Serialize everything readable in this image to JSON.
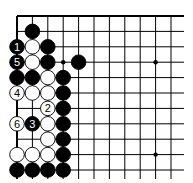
{
  "diagram": {
    "type": "go-board-fragment",
    "grid": {
      "origin_x": 17,
      "origin_y": 16,
      "spacing": 15.4,
      "cols": 11,
      "rows": 11,
      "right_extent": 184,
      "bottom_extent": 179,
      "line_color": "#000000",
      "edge_top": true,
      "edge_left": true
    },
    "star_points": [
      {
        "col": 9,
        "row": 3
      },
      {
        "col": 9,
        "row": 9
      }
    ],
    "markers": [
      {
        "col": 3,
        "row": 3,
        "type": "dot"
      }
    ],
    "stones": [
      {
        "col": 1,
        "row": 1,
        "color": "black",
        "label": ""
      },
      {
        "col": 0,
        "row": 2,
        "color": "black",
        "label": "1"
      },
      {
        "col": 1,
        "row": 2,
        "color": "white",
        "label": ""
      },
      {
        "col": 2,
        "row": 2,
        "color": "black",
        "label": ""
      },
      {
        "col": 0,
        "row": 3,
        "color": "black",
        "label": "5"
      },
      {
        "col": 1,
        "row": 3,
        "color": "white",
        "label": ""
      },
      {
        "col": 2,
        "row": 3,
        "color": "black",
        "label": ""
      },
      {
        "col": 4,
        "row": 3,
        "color": "black",
        "label": ""
      },
      {
        "col": 0,
        "row": 4,
        "color": "black",
        "label": ""
      },
      {
        "col": 1,
        "row": 4,
        "color": "black",
        "label": ""
      },
      {
        "col": 2,
        "row": 4,
        "color": "white",
        "label": ""
      },
      {
        "col": 3,
        "row": 4,
        "color": "black",
        "label": ""
      },
      {
        "col": 0,
        "row": 5,
        "color": "white",
        "label": "4"
      },
      {
        "col": 1,
        "row": 5,
        "color": "white",
        "label": ""
      },
      {
        "col": 2,
        "row": 5,
        "color": "white",
        "label": ""
      },
      {
        "col": 3,
        "row": 5,
        "color": "black",
        "label": ""
      },
      {
        "col": 2,
        "row": 6,
        "color": "white",
        "label": "2"
      },
      {
        "col": 3,
        "row": 6,
        "color": "black",
        "label": ""
      },
      {
        "col": 0,
        "row": 7,
        "color": "white",
        "label": "6"
      },
      {
        "col": 1,
        "row": 7,
        "color": "black",
        "label": "3"
      },
      {
        "col": 2,
        "row": 7,
        "color": "white",
        "label": ""
      },
      {
        "col": 3,
        "row": 7,
        "color": "black",
        "label": ""
      },
      {
        "col": 2,
        "row": 8,
        "color": "white",
        "label": ""
      },
      {
        "col": 3,
        "row": 8,
        "color": "black",
        "label": ""
      },
      {
        "col": 0,
        "row": 9,
        "color": "white",
        "label": ""
      },
      {
        "col": 1,
        "row": 9,
        "color": "white",
        "label": ""
      },
      {
        "col": 2,
        "row": 9,
        "color": "white",
        "label": ""
      },
      {
        "col": 3,
        "row": 9,
        "color": "black",
        "label": ""
      },
      {
        "col": 0,
        "row": 10,
        "color": "black",
        "label": ""
      },
      {
        "col": 1,
        "row": 10,
        "color": "black",
        "label": ""
      },
      {
        "col": 2,
        "row": 10,
        "color": "black",
        "label": ""
      },
      {
        "col": 3,
        "row": 10,
        "color": "black",
        "label": ""
      }
    ],
    "colors": {
      "black_stone": "#000000",
      "white_stone": "#ffffff",
      "stone_outline": "#000000"
    }
  }
}
